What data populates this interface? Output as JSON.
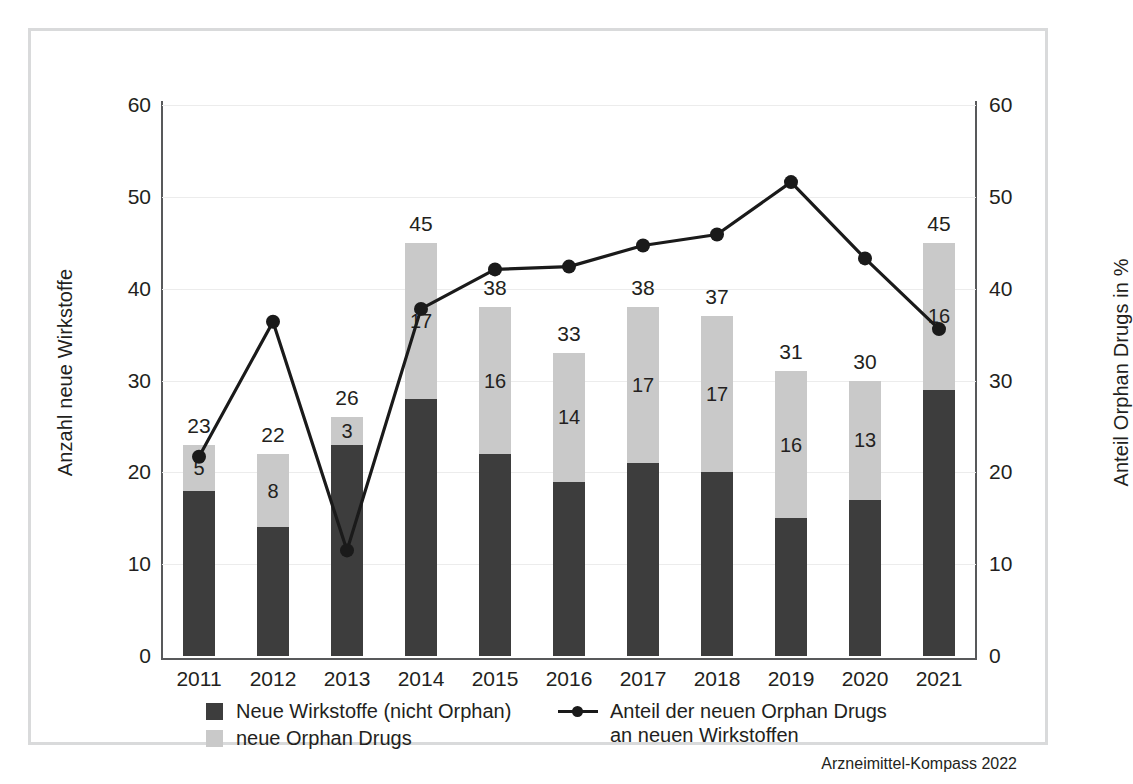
{
  "chart_data": {
    "type": "bar",
    "title": "",
    "subtitle": "",
    "xlabel": "",
    "ylabel": "Anzahl neue Wirkstoffe",
    "y2label": "Anteil Orphan Drugs in %",
    "categories": [
      "2011",
      "2012",
      "2013",
      "2014",
      "2015",
      "2016",
      "2017",
      "2018",
      "2019",
      "2020",
      "2021"
    ],
    "ylim": [
      0,
      60
    ],
    "y2lim": [
      0,
      60
    ],
    "yticks": [
      0,
      10,
      20,
      30,
      40,
      50,
      60
    ],
    "y2ticks": [
      0,
      10,
      20,
      30,
      40,
      50,
      60
    ],
    "grid": true,
    "stacked": true,
    "legend_position": "bottom",
    "series": [
      {
        "name": "Neue Wirkstoffe (nicht Orphan)",
        "kind": "bar",
        "color": "#3d3d3d",
        "values": [
          18,
          14,
          23,
          28,
          22,
          19,
          21,
          20,
          15,
          17,
          29
        ]
      },
      {
        "name": "neue Orphan Drugs",
        "kind": "bar",
        "color": "#c9c9c9",
        "values": [
          5,
          8,
          3,
          17,
          16,
          14,
          17,
          17,
          16,
          13,
          16
        ]
      },
      {
        "name": "Anteil der neuen Orphan Drugs\nan neuen Wirkstoffen",
        "kind": "line",
        "axis": "right",
        "color": "#1a1a1a",
        "values": [
          21.7,
          36.4,
          11.5,
          37.8,
          42.1,
          42.4,
          44.7,
          45.9,
          51.6,
          43.3,
          35.6
        ]
      }
    ],
    "bar_totals": [
      23,
      22,
      26,
      45,
      38,
      33,
      38,
      37,
      31,
      30,
      45
    ],
    "orphan_labels": [
      5,
      8,
      3,
      17,
      16,
      14,
      17,
      17,
      16,
      13,
      16
    ],
    "source": "Arzneimittel-Kompass 2022"
  },
  "axes": {
    "left_title": "Anzahl neue Wirkstoffe",
    "right_title": "Anteil Orphan Drugs in %",
    "left_ticks": [
      "60",
      "50",
      "40",
      "30",
      "20",
      "10",
      "0"
    ],
    "right_ticks": [
      "60",
      "50",
      "40",
      "30",
      "20",
      "10",
      "0"
    ],
    "x_ticks": [
      "2011",
      "2012",
      "2013",
      "2014",
      "2015",
      "2016",
      "2017",
      "2018",
      "2019",
      "2020",
      "2021"
    ]
  },
  "legend": {
    "items": [
      {
        "label": "Neue Wirkstoffe (nicht Orphan)",
        "marker": "square-dark"
      },
      {
        "label": "neue Orphan Drugs",
        "marker": "square-light"
      },
      {
        "label": "Anteil der neuen Orphan Drugs\nan neuen Wirkstoffen",
        "marker": "line-with-dot"
      }
    ]
  },
  "source": {
    "text": "Arzneimittel-Kompass 2022"
  },
  "colors": {
    "bar_dark": "#3d3d3d",
    "bar_light": "#c9c9c9",
    "line": "#1a1a1a",
    "grid": "#ececec",
    "axis": "#58595b",
    "frame": "#d9dadb",
    "text": "#231f20",
    "background": "#ffffff"
  }
}
